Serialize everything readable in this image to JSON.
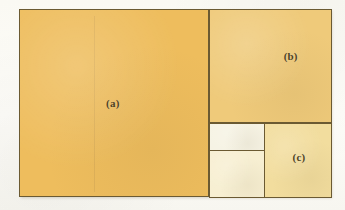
{
  "figure": {
    "kind": "geometric-subdivision-diagram",
    "background_color": "#fdfdfb",
    "line_color": "#6b5a32"
  },
  "outer_rect": {
    "name": "outer-bounding-rectangle",
    "fill_color": "#efcf83",
    "x": 19,
    "y": 9,
    "width": 311,
    "height": 187
  },
  "regions": [
    {
      "id": "a",
      "label": "(a)",
      "role": "large-left-square",
      "fill_color": "#eebd5d",
      "x": 19,
      "y": 9,
      "width": 189,
      "height": 187
    },
    {
      "id": "b",
      "label": "(b)",
      "role": "upper-right-square",
      "fill_color": "#efca7a",
      "x": 208,
      "y": 9,
      "width": 122,
      "height": 113
    },
    {
      "id": "c",
      "label": "(c)",
      "role": "lower-right-square",
      "fill_color": "#f2dd9e",
      "x": 263,
      "y": 122,
      "width": 67,
      "height": 74
    },
    {
      "id": "d",
      "label": "",
      "role": "small-upper-pale-rectangle",
      "fill_color": "#f6f3e4",
      "x": 208,
      "y": 122,
      "width": 55,
      "height": 26
    },
    {
      "id": "e",
      "label": "",
      "role": "small-lower-pale-rectangle",
      "fill_color": "#f7efd2",
      "x": 208,
      "y": 148,
      "width": 55,
      "height": 48
    }
  ],
  "dividers": [
    {
      "name": "vertical-divider-a-right",
      "orientation": "vertical",
      "position": 208
    },
    {
      "name": "horizontal-divider-below-b",
      "orientation": "horizontal",
      "position": 122
    },
    {
      "name": "vertical-divider-left-of-c",
      "orientation": "vertical",
      "position": 263
    },
    {
      "name": "horizontal-divider-small-rects",
      "orientation": "horizontal",
      "position": 148
    }
  ]
}
